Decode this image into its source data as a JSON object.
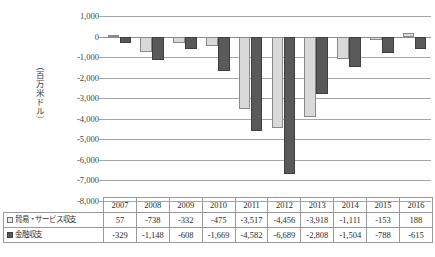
{
  "axis": {
    "y_label": "（百万米ドル）",
    "ticks": [
      "1,000",
      "0",
      "-1,000",
      "-2,000",
      "-3,000",
      "-4,000",
      "-5,000",
      "-6,000",
      "-7,000",
      "-8,000"
    ]
  },
  "legend": {
    "trade_marker": "□",
    "trade_label": "貿易・サービス収支",
    "fin_marker": "■",
    "fin_label": "金融収支"
  },
  "colors": {
    "trade_fill": "#d9d9d9",
    "trade_border": "#8a8a8a",
    "fin_fill": "#595959",
    "fin_border": "#404040",
    "gridline": "#a6a6a6",
    "table_border": "#9a9a9a"
  },
  "table": {
    "header_blank": "",
    "years": [
      "2007",
      "2008",
      "2009",
      "2010",
      "2011",
      "2012",
      "2013",
      "2014",
      "2015",
      "2016"
    ],
    "rows": [
      {
        "label": "貿易・サービス収支",
        "values": [
          "57",
          "-738",
          "-332",
          "-475",
          "-3,517",
          "-4,456",
          "-3,918",
          "-1,111",
          "-153",
          "188"
        ]
      },
      {
        "label": "金融収支",
        "values": [
          "-329",
          "-1,148",
          "-608",
          "-1,669",
          "-4,582",
          "-6,689",
          "-2,808",
          "-1,504",
          "-788",
          "-615"
        ]
      }
    ]
  },
  "chart_data": {
    "type": "bar",
    "title": "",
    "xlabel": "",
    "ylabel": "（百万米ドル）",
    "categories": [
      "2007",
      "2008",
      "2009",
      "2010",
      "2011",
      "2012",
      "2013",
      "2014",
      "2015",
      "2016"
    ],
    "series": [
      {
        "name": "貿易・サービス収支",
        "values": [
          57,
          -738,
          -332,
          -475,
          -3517,
          -4456,
          -3918,
          -1111,
          -153,
          188
        ]
      },
      {
        "name": "金融収支",
        "values": [
          -329,
          -1148,
          -608,
          -1669,
          -4582,
          -6689,
          -2808,
          -1504,
          -788,
          -615
        ]
      }
    ],
    "ylim": [
      -8000,
      1000
    ],
    "ytick_step": 1000,
    "grid": true,
    "legend_position": "table-below"
  }
}
